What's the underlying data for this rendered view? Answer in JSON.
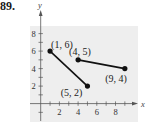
{
  "problem": {
    "number": "89."
  },
  "chart_data": {
    "type": "line",
    "title": "",
    "xlabel": "x",
    "ylabel": "y",
    "xlim": [
      -1,
      10
    ],
    "ylim": [
      -1,
      9
    ],
    "x_ticks": [
      2,
      4,
      6,
      8
    ],
    "y_ticks": [
      2,
      4,
      6,
      8
    ],
    "grid": false,
    "legend": null,
    "series": [
      {
        "name": "segment-1",
        "points": [
          [
            1,
            6
          ],
          [
            5,
            2
          ]
        ],
        "labels": [
          "(1, 6)",
          "(5, 2)"
        ],
        "color": "#111111"
      },
      {
        "name": "segment-2",
        "points": [
          [
            4,
            5
          ],
          [
            9,
            4
          ]
        ],
        "labels": [
          "(4, 5)",
          "(9, 4)"
        ],
        "color": "#111111"
      }
    ]
  },
  "colors": {
    "plot_background": "#eeeeee",
    "axis": "#555555",
    "line": "#111111"
  }
}
